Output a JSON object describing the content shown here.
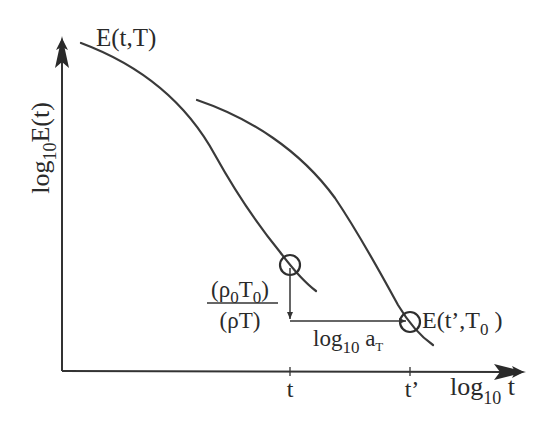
{
  "diagram": {
    "colors": {
      "ink": "#333333",
      "background": "#ffffff"
    },
    "axes": {
      "y_label": {
        "prefix": "log",
        "sub": "10",
        "suffix": "E(t)"
      },
      "x_label": {
        "prefix": "log",
        "sub": "10",
        "suffix": " t"
      },
      "x_ticks": [
        {
          "label": "t"
        },
        {
          "label": "t’"
        }
      ]
    },
    "curves": [
      {
        "id": "curve-T",
        "label": "E(t,T)"
      },
      {
        "id": "curve-T0",
        "label_prefix": "E(t’,T",
        "label_sub": "0",
        "label_suffix": " )"
      }
    ],
    "annotations": {
      "vertical_shift": {
        "numerator": {
          "open": "(ρ",
          "sub1": "0",
          "mid": "T",
          "sub2": "0",
          "close": ")"
        },
        "denominator": "(ρT)"
      },
      "horizontal_shift": {
        "prefix": "log",
        "sub": "10",
        "mid": " a",
        "sub2": "T"
      }
    }
  }
}
